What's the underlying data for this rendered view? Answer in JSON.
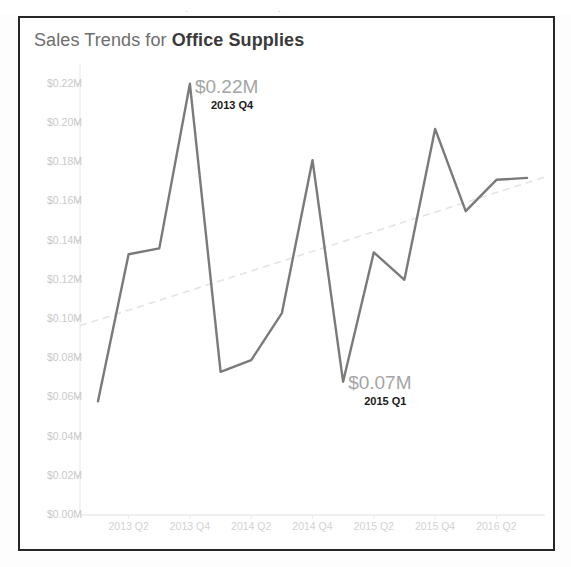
{
  "top_fragment": {
    "left_text": ".",
    "right_text": "."
  },
  "card": {
    "title_prefix": "Sales Trends for ",
    "title_emphasis": "Office Supplies"
  },
  "chart_data": {
    "type": "line",
    "title": "Sales Trends for Office Supplies",
    "xlabel": "",
    "ylabel": "",
    "ylim": [
      0,
      0.225
    ],
    "grid": false,
    "legend": "none",
    "y_tick_labels": [
      "$0.22M",
      "$0.20M",
      "$0.18M",
      "$0.16M",
      "$0.14M",
      "$0.12M",
      "$0.10M",
      "$0.08M",
      "$0.06M",
      "$0.04M",
      "$0.02M",
      "$0.00M"
    ],
    "y_tick_values": [
      0.22,
      0.2,
      0.18,
      0.16,
      0.14,
      0.12,
      0.1,
      0.08,
      0.06,
      0.04,
      0.02,
      0.0
    ],
    "x_tick_labels": [
      "2013 Q2",
      "2013 Q4",
      "2014 Q2",
      "2014 Q4",
      "2015 Q2",
      "2015 Q4",
      "2016 Q2"
    ],
    "categories": [
      "2013 Q1",
      "2013 Q2",
      "2013 Q3",
      "2013 Q4",
      "2014 Q1",
      "2014 Q2",
      "2014 Q3",
      "2014 Q4",
      "2015 Q1",
      "2015 Q2",
      "2015 Q3",
      "2015 Q4",
      "2016 Q1",
      "2016 Q2",
      "2016 Q3"
    ],
    "series": [
      {
        "name": "Sales",
        "color": "#7a7a7a",
        "values": [
          0.058,
          0.133,
          0.136,
          0.22,
          0.073,
          0.079,
          0.103,
          0.181,
          0.068,
          0.134,
          0.12,
          0.197,
          0.155,
          0.171,
          0.172
        ]
      },
      {
        "name": "Trend Line",
        "color": "#e4e4e4",
        "style": "dashed",
        "values": [
          0.0995,
          0.1045,
          0.1095,
          0.1145,
          0.1195,
          0.1245,
          0.1295,
          0.1345,
          0.1395,
          0.1445,
          0.1495,
          0.1545,
          0.1595,
          0.1645,
          0.1695
        ]
      }
    ],
    "annotations": [
      {
        "name": "max-point",
        "value_label": "$0.22M",
        "period_label": "2013 Q4",
        "category": "2013 Q4",
        "value": 0.22
      },
      {
        "name": "min-point",
        "value_label": "$0.07M",
        "period_label": "2015 Q1",
        "category": "2015 Q1",
        "value": 0.068
      }
    ]
  }
}
